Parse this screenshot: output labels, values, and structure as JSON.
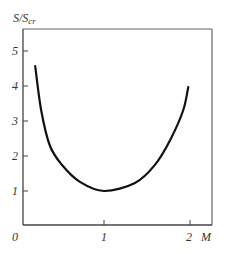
{
  "chart_data": {
    "type": "line",
    "title": "",
    "xlabel": "M",
    "ylabel": "S/S_cr",
    "ylabel_main": "S/S",
    "ylabel_sub": "cr",
    "origin_label": "0",
    "x_ticks": [
      "1",
      "2"
    ],
    "y_ticks": [
      "1",
      "2",
      "3",
      "4",
      "5"
    ],
    "xlim": [
      0,
      2.2
    ],
    "ylim": [
      0,
      5.6
    ],
    "grid": false,
    "legend": null,
    "series": [
      {
        "name": "S/S_cr vs M",
        "x": [
          0.2,
          0.27,
          0.37,
          0.51,
          0.72,
          1.0,
          1.36,
          1.59,
          1.77,
          1.92,
          1.98
        ],
        "y": [
          4.57,
          3.3,
          2.3,
          1.75,
          1.26,
          1.0,
          1.23,
          1.74,
          2.46,
          3.3,
          3.97
        ]
      }
    ]
  },
  "colors": {
    "axis": "#555555",
    "curve": "#111111",
    "text": "#333333"
  }
}
